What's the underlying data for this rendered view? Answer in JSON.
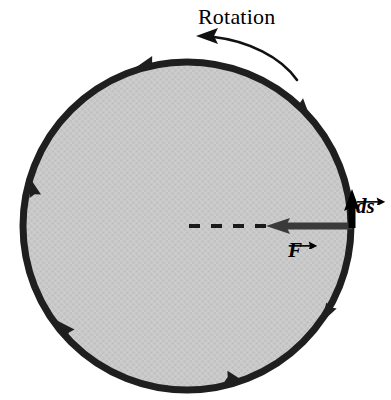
{
  "figure": {
    "background_color": "#ffffff"
  },
  "labels": {
    "rotation": "Rotation",
    "force_vector": "F",
    "displacement_vector": "ds"
  },
  "disk": {
    "fill_color": "#c8c8c8",
    "stroke_color": "#1a1a1a",
    "center_x": 187,
    "center_y": 226,
    "radius": 164,
    "stroke_width": 7,
    "rim_arrow_count": 6
  },
  "vectors": {
    "force": {
      "name": "F",
      "color": "#2b2b2b",
      "direction": "left",
      "tail_x": 352,
      "tail_y": 226,
      "head_x": 268,
      "head_y": 226,
      "description": "radially inward along dashed radius"
    },
    "displacement": {
      "name": "ds",
      "color": "#000000",
      "direction": "up",
      "tail_x": 352,
      "tail_y": 226,
      "head_x": 352,
      "head_y": 192,
      "description": "tangent to rim at contact point"
    }
  },
  "radius_line": {
    "style": "dashed",
    "color": "#1a1a1a",
    "from_x": 187,
    "from_y": 226,
    "to_x": 268,
    "to_y": 226
  },
  "rotation_arrow": {
    "direction": "counterclockwise",
    "color": "#111111",
    "start_x": 296,
    "start_y": 78,
    "end_x": 198,
    "end_y": 38
  }
}
